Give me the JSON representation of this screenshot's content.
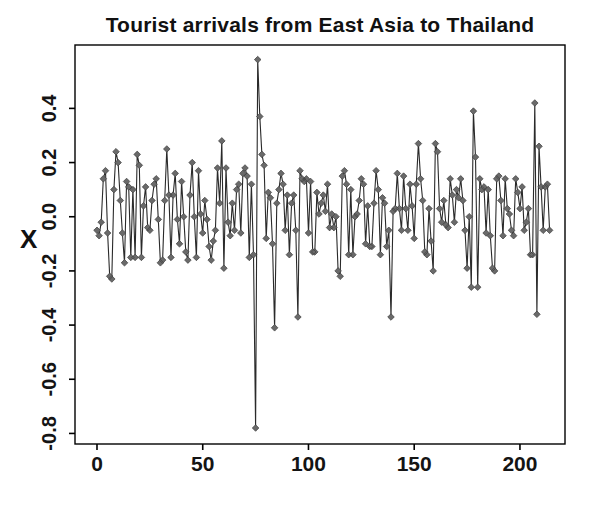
{
  "figure": {
    "title": "Tourist arrivals from East Asia to Thailand",
    "y_axis_label": "X"
  },
  "chart_data": {
    "type": "line",
    "title": "Tourist arrivals from East Asia to Thailand",
    "xlabel": "",
    "ylabel": "X",
    "legend": "none",
    "grid": false,
    "marker": "diamond",
    "line_color": "#2a2a2a",
    "marker_fill": "#6a6a6a",
    "marker_stroke": "#3d3d3d",
    "axis_color": "#000000",
    "x_start": 0,
    "xlim": [
      -10.4,
      221.3
    ],
    "ylim": [
      -0.839,
      0.634
    ],
    "x_tick_values": [
      0,
      50,
      100,
      150,
      200
    ],
    "x_tick_labels": [
      "0",
      "50",
      "100",
      "150",
      "200"
    ],
    "y_tick_values": [
      0.4,
      0.2,
      0.0,
      -0.2,
      -0.4,
      -0.6,
      -0.8
    ],
    "y_tick_labels": [
      "0.4",
      "0.2",
      "0.0",
      "-0.2",
      "-0.4",
      "-0.6",
      "-0.8"
    ],
    "values": [
      -0.05,
      -0.07,
      -0.02,
      0.14,
      0.17,
      -0.06,
      -0.22,
      -0.23,
      0.1,
      0.24,
      0.2,
      0.06,
      -0.06,
      -0.17,
      0.13,
      0.11,
      -0.15,
      0.1,
      -0.15,
      0.23,
      0.19,
      -0.15,
      0.04,
      0.11,
      -0.04,
      -0.05,
      0.06,
      0.12,
      0.14,
      -0.01,
      -0.17,
      -0.16,
      0.06,
      0.25,
      0.08,
      -0.15,
      0.08,
      0.16,
      -0.01,
      -0.1,
      0.13,
      0.0,
      -0.13,
      -0.16,
      0.08,
      0.2,
      0.0,
      -0.15,
      0.17,
      0.01,
      -0.06,
      0.06,
      -0.01,
      -0.11,
      -0.16,
      -0.09,
      -0.05,
      0.18,
      0.05,
      0.28,
      -0.19,
      0.18,
      -0.02,
      -0.07,
      0.05,
      -0.05,
      0.1,
      0.12,
      -0.06,
      0.16,
      0.18,
      0.15,
      -0.15,
      0.12,
      -0.14,
      -0.78,
      0.58,
      0.37,
      0.23,
      0.19,
      -0.08,
      0.09,
      0.07,
      -0.1,
      -0.41,
      0.05,
      0.1,
      0.16,
      0.12,
      -0.05,
      0.08,
      -0.14,
      0.05,
      0.08,
      -0.05,
      -0.37,
      0.17,
      0.14,
      0.13,
      0.14,
      -0.06,
      0.13,
      -0.13,
      -0.13,
      0.09,
      0.01,
      0.05,
      0.08,
      0.02,
      0.12,
      -0.04,
      0.01,
      -0.04,
      0.0,
      -0.2,
      -0.22,
      0.15,
      0.17,
      0.12,
      -0.14,
      0.1,
      -0.14,
      0.0,
      0.01,
      0.06,
      0.14,
      0.12,
      -0.1,
      0.04,
      -0.11,
      -0.11,
      0.05,
      0.17,
      0.1,
      -0.14,
      0.07,
      0.05,
      -0.11,
      -0.05,
      -0.37,
      0.02,
      0.03,
      0.16,
      0.03,
      -0.05,
      0.15,
      0.03,
      -0.05,
      0.12,
      0.04,
      -0.08,
      0.12,
      0.27,
      0.14,
      0.06,
      -0.13,
      -0.14,
      0.03,
      -0.09,
      -0.2,
      0.27,
      0.24,
      0.03,
      -0.02,
      0.06,
      -0.03,
      -0.04,
      0.14,
      0.08,
      -0.02,
      0.1,
      0.07,
      0.14,
      0.06,
      -0.05,
      -0.19,
      0.0,
      -0.26,
      0.39,
      0.22,
      -0.26,
      0.14,
      0.1,
      0.11,
      -0.06,
      0.1,
      -0.07,
      -0.19,
      -0.2,
      0.14,
      0.15,
      0.06,
      -0.07,
      0.14,
      0.03,
      0.01,
      -0.05,
      -0.07,
      0.14,
      0.09,
      0.03,
      0.11,
      -0.05,
      -0.02,
      0.03,
      -0.14,
      -0.14,
      0.42,
      -0.36,
      0.26,
      0.11,
      -0.05,
      0.11,
      0.12,
      -0.05
    ]
  }
}
